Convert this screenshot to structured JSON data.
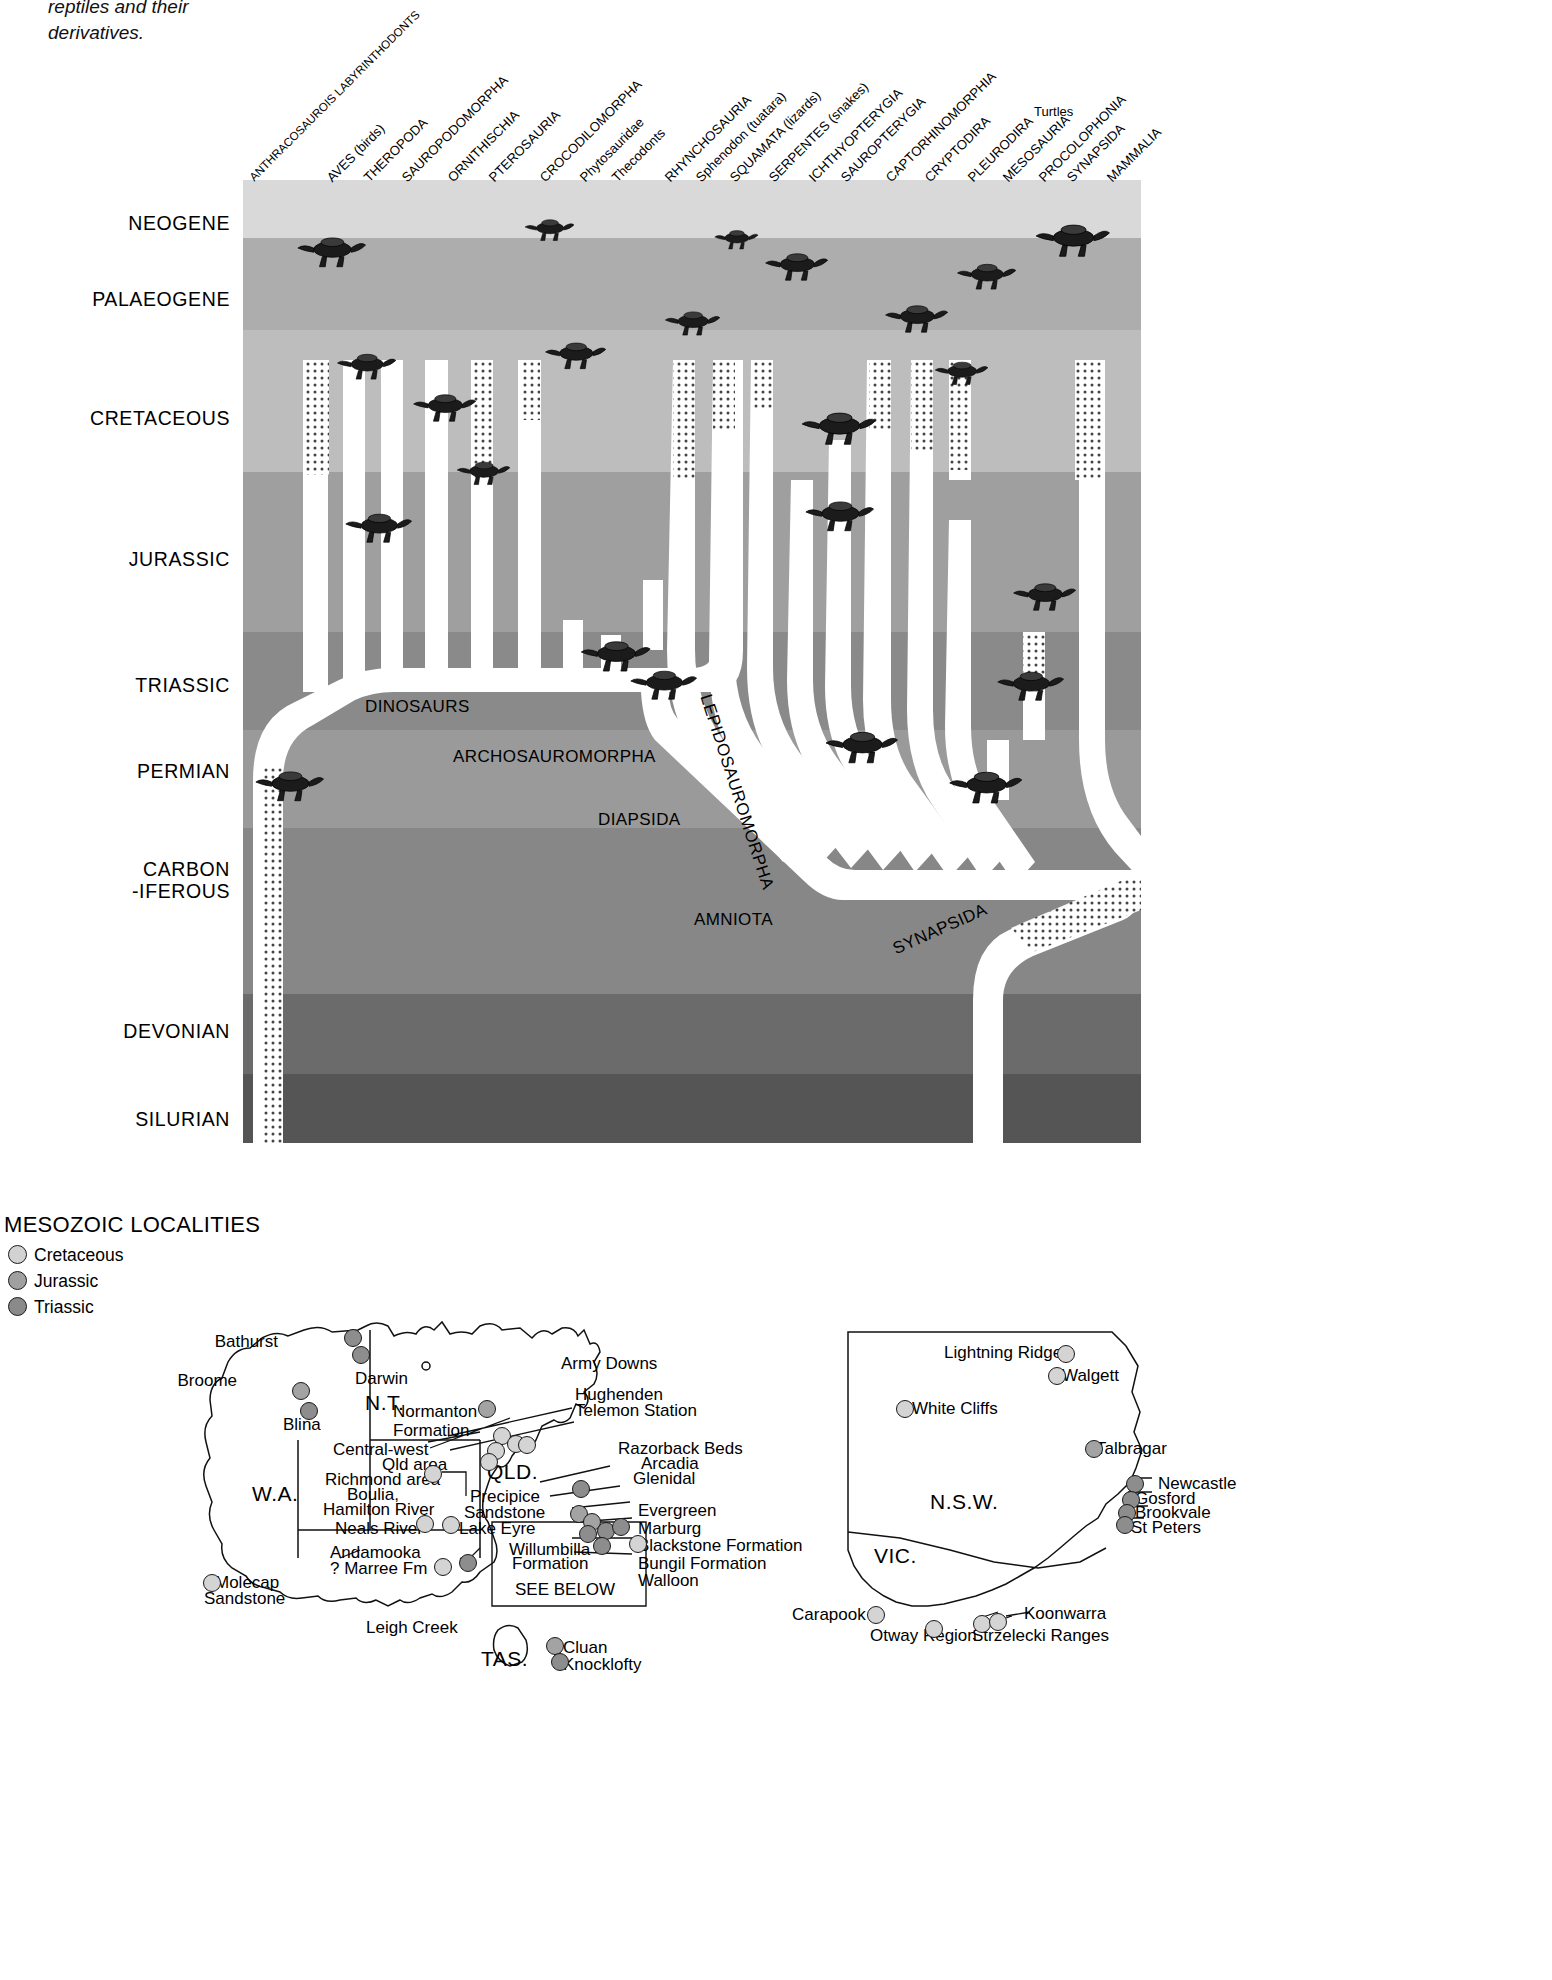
{
  "caption": "reptiles and their\nderivatives.",
  "chart": {
    "title_hidden": "",
    "periods": [
      {
        "label": "NEOGENE",
        "y": 32
      },
      {
        "label": "PALAEOGENE",
        "y": 108
      },
      {
        "label": "CRETACEOUS",
        "y": 227
      },
      {
        "label": "JURASSIC",
        "y": 368
      },
      {
        "label": "TRIASSIC",
        "y": 494
      },
      {
        "label": "PERMIAN",
        "y": 580
      },
      {
        "label": "CARBON\n-IFEROUS",
        "y": 678
      },
      {
        "label": "DEVONIAN",
        "y": 840
      },
      {
        "label": "SILURIAN",
        "y": 928
      }
    ],
    "taxa": [
      {
        "label": "ANTHRACOSAUROIS LABYRINTHODONTS",
        "x": 8
      },
      {
        "label": "AVES (birds)",
        "x": 86
      },
      {
        "label": "THEROPODA",
        "x": 123
      },
      {
        "label": "SAUROPODOMORPHA",
        "x": 161
      },
      {
        "label": "ORNITHISCHIA",
        "x": 207
      },
      {
        "label": "PTEROSAURIA",
        "x": 248
      },
      {
        "label": "CROCODILOMORPHA",
        "x": 299
      },
      {
        "label": "Phytosauridae",
        "x": 339
      },
      {
        "label": "Thecodonts",
        "x": 371
      },
      {
        "label": "RHYNCHOSAURIA",
        "x": 424
      },
      {
        "label": "Sphenodon (tuatara)",
        "x": 455
      },
      {
        "label": "SQUAMATA (lizards)",
        "x": 489
      },
      {
        "label": "SERPENTES (snakes)",
        "x": 528
      },
      {
        "label": "ICHTHYOPTERYGIA",
        "x": 568
      },
      {
        "label": "SAUROPTERYGIA",
        "x": 600
      },
      {
        "label": "CAPTORHINOMORPHIA",
        "x": 645
      },
      {
        "label": "CRYPTODIRA",
        "x": 684
      },
      {
        "label": "PLEURODIRA",
        "x": 727
      },
      {
        "label": "MESOSAURIA",
        "x": 762
      },
      {
        "label": "PROCOLOPHONIA",
        "x": 798
      },
      {
        "label": "SYNAPSIDA",
        "x": 826
      },
      {
        "label": "MAMMALIA",
        "x": 866
      }
    ],
    "turtles_label": "Turtles",
    "clades": [
      {
        "label": "DINOSAURS",
        "x": 122,
        "y": 517,
        "rot": 0
      },
      {
        "label": "ARCHOSAUROMORPHA",
        "x": 210,
        "y": 567,
        "rot": 0
      },
      {
        "label": "LEPIDOSAUROMORPHA",
        "x": 462,
        "y": 505,
        "rot": 72
      },
      {
        "label": "DIAPSIDA",
        "x": 355,
        "y": 630,
        "rot": 0
      },
      {
        "label": "AMNIOTA",
        "x": 451,
        "y": 730,
        "rot": 0
      },
      {
        "label": "SYNAPSIDA",
        "x": 651,
        "y": 760,
        "rot": -24
      }
    ],
    "bands": [
      {
        "name": "Neogene",
        "top": 0,
        "height": 58,
        "color": "#d9d9d9"
      },
      {
        "name": "Palaeogene",
        "top": 58,
        "height": 92,
        "color": "#adadad"
      },
      {
        "name": "Cretaceous",
        "top": 150,
        "height": 142,
        "color": "#bdbdbd"
      },
      {
        "name": "Jurassic",
        "top": 292,
        "height": 160,
        "color": "#9f9f9f"
      },
      {
        "name": "Triassic",
        "top": 452,
        "height": 98,
        "color": "#8a8a8a"
      },
      {
        "name": "Permian",
        "top": 550,
        "height": 98,
        "color": "#9a9a9a"
      },
      {
        "name": "Carboniferous",
        "top": 648,
        "height": 166,
        "color": "#878787"
      },
      {
        "name": "Devonian",
        "top": 814,
        "height": 80,
        "color": "#6b6b6b"
      },
      {
        "name": "Silurian",
        "top": 894,
        "height": 69,
        "color": "#555555"
      }
    ]
  },
  "maps": {
    "legend": {
      "title": "MESOZOIC LOCALITIES",
      "items": [
        {
          "label": "Cretaceous",
          "class": "d-cret"
        },
        {
          "label": "Jurassic",
          "class": "d-jur"
        },
        {
          "label": "Triassic",
          "class": "d-tri"
        }
      ]
    },
    "australia_labels": [
      {
        "text": "Bathurst",
        "x": 278,
        "y": 183,
        "align": "r"
      },
      {
        "text": "Darwin",
        "x": 355,
        "y": 220,
        "align": "l"
      },
      {
        "text": "Broome",
        "x": 237,
        "y": 222,
        "align": "r"
      },
      {
        "text": "N.T.",
        "x": 365,
        "y": 241,
        "align": "l",
        "big": true
      },
      {
        "text": "Blina",
        "x": 283,
        "y": 266,
        "align": "l"
      },
      {
        "text": "Normanton\nFormation",
        "x": 393,
        "y": 253,
        "align": "l"
      },
      {
        "text": "Army Downs",
        "x": 561,
        "y": 205,
        "align": "l"
      },
      {
        "text": "Hughenden",
        "x": 575,
        "y": 236,
        "align": "l"
      },
      {
        "text": "Telemon Station",
        "x": 575,
        "y": 252,
        "align": "l"
      },
      {
        "text": "Central-west",
        "x": 333,
        "y": 291,
        "align": "l"
      },
      {
        "text": "Qld area",
        "x": 382,
        "y": 306,
        "align": "l"
      },
      {
        "text": "Richmond area",
        "x": 325,
        "y": 321,
        "align": "l"
      },
      {
        "text": "Boulia,",
        "x": 347,
        "y": 336,
        "align": "l"
      },
      {
        "text": "Hamilton River",
        "x": 323,
        "y": 351,
        "align": "l"
      },
      {
        "text": "Neals River",
        "x": 335,
        "y": 370,
        "align": "l"
      },
      {
        "text": "Lake Eyre",
        "x": 459,
        "y": 370,
        "align": "l"
      },
      {
        "text": "Razorback Beds",
        "x": 618,
        "y": 290,
        "align": "l"
      },
      {
        "text": "Arcadia",
        "x": 641,
        "y": 305,
        "align": "l"
      },
      {
        "text": "Glenidal",
        "x": 633,
        "y": 320,
        "align": "l"
      },
      {
        "text": "QLD.",
        "x": 487,
        "y": 310,
        "align": "l",
        "big": true
      },
      {
        "text": "Precipice",
        "x": 470,
        "y": 338,
        "align": "l"
      },
      {
        "text": "Sandstone",
        "x": 464,
        "y": 354,
        "align": "l"
      },
      {
        "text": "Evergreen",
        "x": 638,
        "y": 352,
        "align": "l"
      },
      {
        "text": "Marburg",
        "x": 638,
        "y": 370,
        "align": "l"
      },
      {
        "text": "Blackstone Formation",
        "x": 638,
        "y": 387,
        "align": "l"
      },
      {
        "text": "Willumbilla",
        "x": 509,
        "y": 391,
        "align": "l"
      },
      {
        "text": "Formation",
        "x": 512,
        "y": 405,
        "align": "l"
      },
      {
        "text": "Bungil Formation",
        "x": 638,
        "y": 405,
        "align": "l"
      },
      {
        "text": "Walloon",
        "x": 638,
        "y": 422,
        "align": "l"
      },
      {
        "text": "SEE BELOW",
        "x": 515,
        "y": 431,
        "align": "l"
      },
      {
        "text": "Andamooka",
        "x": 330,
        "y": 394,
        "align": "l"
      },
      {
        "text": "? Marree Fm",
        "x": 330,
        "y": 410,
        "align": "l"
      },
      {
        "text": "Molecap",
        "x": 215,
        "y": 424,
        "align": "l"
      },
      {
        "text": "Sandstone",
        "x": 204,
        "y": 440,
        "align": "l"
      },
      {
        "text": "W.A.",
        "x": 252,
        "y": 332,
        "align": "l",
        "big": true
      },
      {
        "text": "Leigh Creek",
        "x": 366,
        "y": 469,
        "align": "l"
      },
      {
        "text": "TAS.",
        "x": 481,
        "y": 497,
        "align": "l",
        "big": true
      },
      {
        "text": "Cluan",
        "x": 563,
        "y": 489,
        "align": "l"
      },
      {
        "text": "Knocklofty",
        "x": 563,
        "y": 506,
        "align": "l"
      }
    ],
    "nsw_labels": [
      {
        "text": "Lightning Ridge",
        "x": 944,
        "y": 194,
        "align": "l"
      },
      {
        "text": "Walgett",
        "x": 1062,
        "y": 217,
        "align": "l"
      },
      {
        "text": "White Cliffs",
        "x": 912,
        "y": 250,
        "align": "l"
      },
      {
        "text": "Talbragar",
        "x": 1096,
        "y": 290,
        "align": "l"
      },
      {
        "text": "Newcastle",
        "x": 1158,
        "y": 325,
        "align": "l"
      },
      {
        "text": "Gosford",
        "x": 1135,
        "y": 340,
        "align": "l"
      },
      {
        "text": "Brookvale",
        "x": 1135,
        "y": 354,
        "align": "l"
      },
      {
        "text": "St Peters",
        "x": 1131,
        "y": 369,
        "align": "l"
      },
      {
        "text": "N.S.W.",
        "x": 930,
        "y": 340,
        "align": "l",
        "big": true
      },
      {
        "text": "VIC.",
        "x": 874,
        "y": 394,
        "align": "l",
        "big": true
      },
      {
        "text": "Carapook",
        "x": 792,
        "y": 456,
        "align": "l"
      },
      {
        "text": "Otway Region",
        "x": 870,
        "y": 477,
        "align": "l"
      },
      {
        "text": "Koonwarra",
        "x": 1024,
        "y": 455,
        "align": "l"
      },
      {
        "text": "Strzelecki Ranges",
        "x": 972,
        "y": 477,
        "align": "l"
      }
    ],
    "australia_dots": [
      {
        "x": 344,
        "y": 179,
        "t": "tri"
      },
      {
        "x": 352,
        "y": 196,
        "t": "tri"
      },
      {
        "x": 292,
        "y": 232,
        "t": "jur"
      },
      {
        "x": 300,
        "y": 252,
        "t": "tri"
      },
      {
        "x": 478,
        "y": 250,
        "t": "jur"
      },
      {
        "x": 493,
        "y": 277,
        "t": "cret"
      },
      {
        "x": 507,
        "y": 285,
        "t": "cret"
      },
      {
        "x": 487,
        "y": 292,
        "t": "cret"
      },
      {
        "x": 518,
        "y": 286,
        "t": "cret"
      },
      {
        "x": 480,
        "y": 303,
        "t": "cret"
      },
      {
        "x": 424,
        "y": 315,
        "t": "cret"
      },
      {
        "x": 416,
        "y": 365,
        "t": "cret"
      },
      {
        "x": 442,
        "y": 366,
        "t": "cret"
      },
      {
        "x": 572,
        "y": 330,
        "t": "tri"
      },
      {
        "x": 570,
        "y": 355,
        "t": "jur"
      },
      {
        "x": 583,
        "y": 363,
        "t": "jur"
      },
      {
        "x": 579,
        "y": 375,
        "t": "tri"
      },
      {
        "x": 597,
        "y": 372,
        "t": "tri"
      },
      {
        "x": 612,
        "y": 368,
        "t": "tri"
      },
      {
        "x": 593,
        "y": 387,
        "t": "tri"
      },
      {
        "x": 629,
        "y": 385,
        "t": "cret"
      },
      {
        "x": 434,
        "y": 408,
        "t": "cret"
      },
      {
        "x": 459,
        "y": 404,
        "t": "tri"
      },
      {
        "x": 203,
        "y": 424,
        "t": "cret"
      },
      {
        "x": 546,
        "y": 487,
        "t": "jur"
      },
      {
        "x": 551,
        "y": 503,
        "t": "tri"
      }
    ],
    "nsw_dots": [
      {
        "x": 1057,
        "y": 195,
        "t": "cret"
      },
      {
        "x": 1048,
        "y": 217,
        "t": "cret"
      },
      {
        "x": 896,
        "y": 250,
        "t": "cret"
      },
      {
        "x": 1085,
        "y": 290,
        "t": "jur"
      },
      {
        "x": 1126,
        "y": 325,
        "t": "tri"
      },
      {
        "x": 1122,
        "y": 341,
        "t": "tri"
      },
      {
        "x": 1118,
        "y": 354,
        "t": "tri"
      },
      {
        "x": 1116,
        "y": 366,
        "t": "tri"
      },
      {
        "x": 867,
        "y": 456,
        "t": "cret"
      },
      {
        "x": 925,
        "y": 470,
        "t": "cret"
      },
      {
        "x": 973,
        "y": 465,
        "t": "cret"
      },
      {
        "x": 989,
        "y": 463,
        "t": "cret"
      }
    ]
  }
}
